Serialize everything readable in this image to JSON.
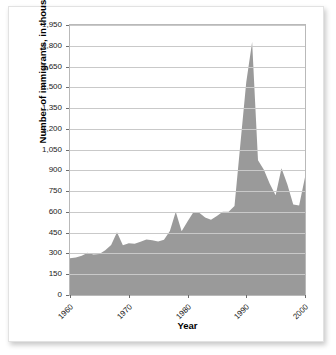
{
  "chart_data": {
    "type": "area",
    "title": "",
    "xlabel": "Year",
    "ylabel": "Number of immigrants, in thousands",
    "xlim": [
      1960,
      2000
    ],
    "ylim": [
      0,
      1950
    ],
    "grid": true,
    "legend": "none",
    "series_color": "#9a9a9a",
    "x_tick_labels": [
      "1960",
      "1970",
      "1980",
      "1990",
      "2000"
    ],
    "x_ticks": [
      1960,
      1970,
      1980,
      1990,
      2000
    ],
    "y_tick_labels": [
      "0",
      "150",
      "300",
      "450",
      "600",
      "750",
      "900",
      "1,050",
      "1,200",
      "1,350",
      "1,500",
      "1,650",
      "1,800",
      "1,950"
    ],
    "y_ticks": [
      0,
      150,
      300,
      450,
      600,
      750,
      900,
      1050,
      1200,
      1350,
      1500,
      1650,
      1800,
      1950
    ],
    "x": [
      1960,
      1961,
      1962,
      1963,
      1964,
      1965,
      1966,
      1967,
      1968,
      1969,
      1970,
      1971,
      1972,
      1973,
      1974,
      1975,
      1976,
      1977,
      1978,
      1979,
      1980,
      1981,
      1982,
      1983,
      1984,
      1985,
      1986,
      1987,
      1988,
      1989,
      1990,
      1991,
      1992,
      1993,
      1994,
      1995,
      1996,
      1997,
      1998,
      1999,
      2000
    ],
    "values": [
      265,
      271,
      284,
      306,
      292,
      297,
      323,
      362,
      454,
      359,
      373,
      370,
      385,
      400,
      395,
      386,
      399,
      462,
      601,
      460,
      531,
      597,
      594,
      560,
      544,
      570,
      602,
      602,
      643,
      1091,
      1536,
      1827,
      974,
      904,
      804,
      720,
      916,
      798,
      654,
      647,
      850
    ],
    "annotations": []
  },
  "axis": {
    "y_title": "Number of immigrants, in thousands",
    "x_title": "Year"
  }
}
